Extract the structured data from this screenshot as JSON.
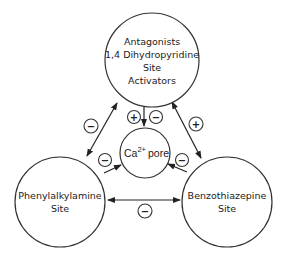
{
  "nodes": {
    "top": {
      "lines": [
        "Antagonists",
        "1,4 Dihydropyridine",
        "Site",
        "Activators"
      ]
    },
    "left": {
      "lines": [
        "Phenylalkylamine",
        "Site"
      ]
    },
    "right": {
      "lines": [
        "Benzothiazepine",
        "Site"
      ]
    },
    "pore": {
      "ca": "Ca",
      "sup": "2+",
      "word": "pore"
    }
  },
  "signs": {
    "top_left_edge": "−",
    "top_right_edge": "+",
    "left_right_edge": "−",
    "top_pore_plus": "+",
    "top_pore_minus": "−",
    "left_pore": "−",
    "right_pore": "−"
  },
  "colors": {
    "stroke": "#333333",
    "background": "#ffffff"
  }
}
